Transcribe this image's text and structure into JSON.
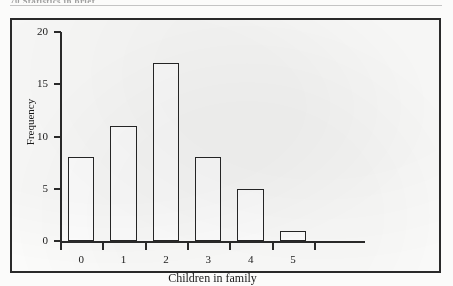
{
  "page": {
    "running_head": "70  Statistics in brief"
  },
  "chart_data": {
    "type": "bar",
    "title": "",
    "xlabel": "Children in family",
    "ylabel": "Frequency",
    "categories": [
      "0",
      "1",
      "2",
      "3",
      "4",
      "5"
    ],
    "values": [
      8,
      11,
      17,
      8,
      5,
      1
    ],
    "ylim": [
      0,
      20
    ],
    "y_ticks": [
      0,
      5,
      10,
      15,
      20
    ],
    "y_tick_labels": [
      "0",
      "5",
      "10",
      "15",
      "20"
    ],
    "grid": false,
    "legend": "none",
    "bar_style": {
      "fill": "#ffffff",
      "edge": "#262626"
    }
  },
  "colors": {
    "ink": "#1a1a1a",
    "axis": "#2a2a2a",
    "paper": "#fbfbfa",
    "frame": "#2a2a2a"
  }
}
